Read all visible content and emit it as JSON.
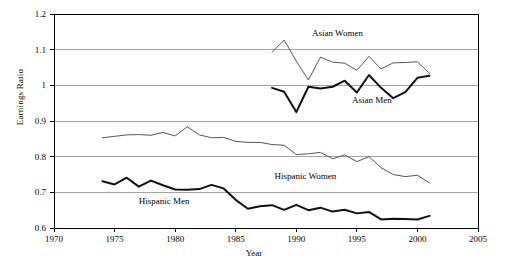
{
  "chart_data": {
    "type": "line",
    "title": "",
    "xlabel": "Year",
    "ylabel": "Earnings Ratio",
    "xlim": [
      1970,
      2005
    ],
    "ylim": [
      0.6,
      1.2
    ],
    "xticks": [
      1970,
      1975,
      1980,
      1985,
      1990,
      1995,
      2000,
      2005
    ],
    "yticks": [
      0.6,
      0.7,
      0.8,
      0.9,
      1.0,
      1.1,
      1.2
    ],
    "ytick_labels": [
      "0.6",
      "0.7",
      "0.8",
      "0.9",
      "1",
      "1.1",
      "1.2"
    ],
    "xtick_labels": [
      "1970",
      "1975",
      "1980",
      "1985",
      "1990",
      "1995",
      "2000",
      "2005"
    ],
    "grid": "horizontal",
    "legend": "inline-annotations",
    "series": [
      {
        "name": "Asian Women",
        "color": "#555555",
        "width": 1.0,
        "label_x": 1991.3,
        "label_y": 1.145,
        "x": [
          1988,
          1989,
          1990,
          1991,
          1992,
          1993,
          1994,
          1995,
          1996,
          1997,
          1998,
          1999,
          2000,
          2001
        ],
        "values": [
          1.093,
          1.127,
          1.068,
          1.015,
          1.079,
          1.065,
          1.062,
          1.042,
          1.081,
          1.046,
          1.063,
          1.064,
          1.066,
          1.033
        ]
      },
      {
        "name": "Asian Men",
        "color": "#111111",
        "width": 2.0,
        "label_x": 1994.6,
        "label_y": 0.955,
        "x": [
          1988,
          1989,
          1990,
          1991,
          1992,
          1993,
          1994,
          1995,
          1996,
          1997,
          1998,
          1999,
          2000,
          2001
        ],
        "values": [
          0.993,
          0.982,
          0.925,
          0.996,
          0.991,
          0.996,
          1.013,
          0.98,
          1.029,
          0.993,
          0.964,
          0.981,
          1.021,
          1.027
        ]
      },
      {
        "name": "Hispanic Women",
        "color": "#555555",
        "width": 1.0,
        "label_x": 1988.2,
        "label_y": 0.742,
        "x": [
          1974,
          1975,
          1976,
          1977,
          1978,
          1979,
          1980,
          1981,
          1982,
          1983,
          1984,
          1985,
          1986,
          1987,
          1988,
          1989,
          1990,
          1991,
          1992,
          1993,
          1994,
          1995,
          1996,
          1997,
          1998,
          1999,
          2000,
          2001
        ],
        "values": [
          0.853,
          0.857,
          0.861,
          0.862,
          0.86,
          0.868,
          0.858,
          0.884,
          0.861,
          0.853,
          0.854,
          0.843,
          0.84,
          0.84,
          0.834,
          0.832,
          0.806,
          0.808,
          0.812,
          0.794,
          0.805,
          0.786,
          0.8,
          0.769,
          0.75,
          0.744,
          0.748,
          0.726
        ]
      },
      {
        "name": "Hispanic Men",
        "color": "#111111",
        "width": 2.0,
        "label_x": 1977.0,
        "label_y": 0.672,
        "x": [
          1974,
          1975,
          1976,
          1977,
          1978,
          1979,
          1980,
          1981,
          1982,
          1983,
          1984,
          1985,
          1986,
          1987,
          1988,
          1989,
          1990,
          1991,
          1992,
          1993,
          1994,
          1995,
          1996,
          1997,
          1998,
          1999,
          2000,
          2001
        ],
        "values": [
          0.731,
          0.722,
          0.741,
          0.716,
          0.733,
          0.72,
          0.708,
          0.707,
          0.709,
          0.721,
          0.711,
          0.679,
          0.654,
          0.661,
          0.664,
          0.651,
          0.665,
          0.65,
          0.657,
          0.646,
          0.651,
          0.641,
          0.645,
          0.624,
          0.626,
          0.625,
          0.624,
          0.634
        ]
      }
    ]
  },
  "colors": {
    "axis": "#000000",
    "grid": "#8c8c8c",
    "light_series": "#555555",
    "dark_series": "#111111",
    "background": "#ffffff"
  }
}
